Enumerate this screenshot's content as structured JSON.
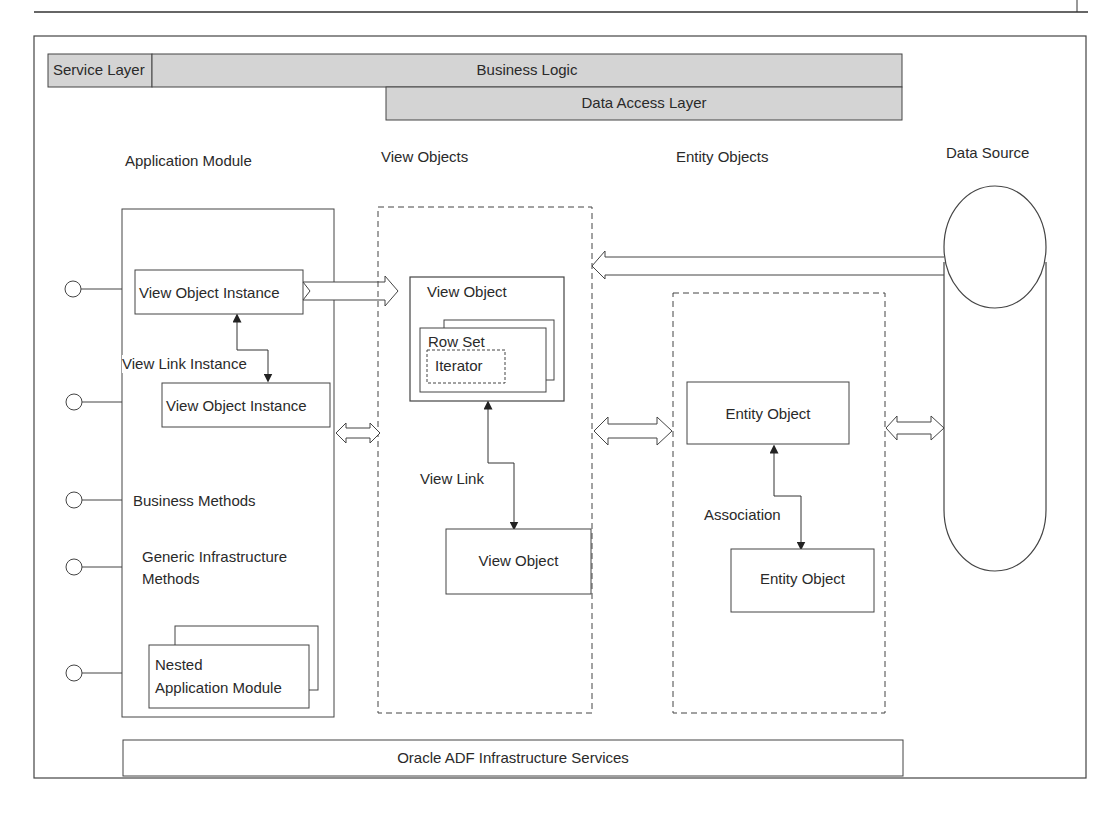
{
  "layers": {
    "service_layer": "Service Layer",
    "business_logic": "Business Logic",
    "data_access_layer": "Data Access Layer",
    "fill_color": "#d4d4d4"
  },
  "columns": {
    "application_module": "Application Module",
    "view_objects": "View Objects",
    "entity_objects": "Entity Objects",
    "data_source": "Data Source"
  },
  "application_module": {
    "view_object_instance_1": "View Object Instance",
    "view_link_instance": "View Link Instance",
    "view_object_instance_2": "View Object Instance",
    "business_methods": "Business Methods",
    "generic_infra_line1": "Generic Infrastructure",
    "generic_infra_line2": "Methods",
    "nested_line1": "Nested",
    "nested_line2": "Application Module"
  },
  "view_objects": {
    "view_object_main": "View Object",
    "row_set": "Row Set",
    "iterator": "Iterator",
    "view_link": "View Link",
    "view_object_secondary": "View Object"
  },
  "entity_objects": {
    "entity_object_1": "Entity Object",
    "association": "Association",
    "entity_object_2": "Entity Object"
  },
  "footer": {
    "infrastructure_services": "Oracle ADF Infrastructure Services"
  },
  "colors": {
    "line": "#333333",
    "layer_fill": "#d4d4d4",
    "background": "#ffffff"
  }
}
